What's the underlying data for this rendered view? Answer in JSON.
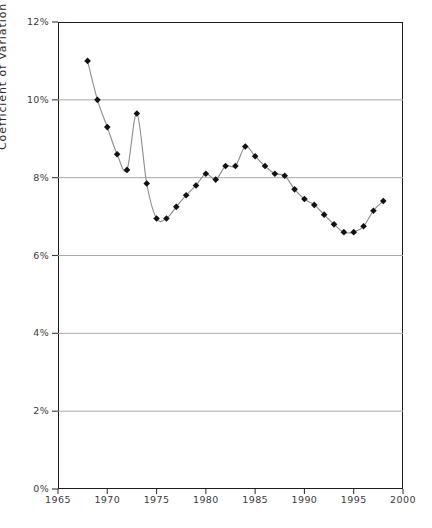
{
  "axes": {
    "y_label": "Coefficient of Variation",
    "y_ticks": [
      "0%",
      "2%",
      "4%",
      "6%",
      "8%",
      "10%",
      "12%"
    ],
    "x_ticks": [
      "1965",
      "1970",
      "1975",
      "1980",
      "1985",
      "1990",
      "1995",
      "2000"
    ]
  },
  "ghost_text": " ",
  "chart_data": {
    "type": "line",
    "title": "",
    "xlabel": "",
    "ylabel": "Coefficient of Variation",
    "xlim": [
      1965,
      2000
    ],
    "ylim": [
      0,
      12
    ],
    "ytick_values": [
      0,
      2,
      4,
      6,
      8,
      10,
      12
    ],
    "ytick_labels": [
      "0%",
      "2%",
      "4%",
      "6%",
      "8%",
      "10%",
      "12%"
    ],
    "xtick_values": [
      1965,
      1970,
      1975,
      1980,
      1985,
      1990,
      1995,
      2000
    ],
    "xtick_labels": [
      "1965",
      "1970",
      "1975",
      "1980",
      "1985",
      "1990",
      "1995",
      "2000"
    ],
    "grid": "horizontal",
    "legend": "none",
    "units": "percent",
    "marker": "diamond",
    "marker_color": "#111111",
    "line_color": "#8d8d8d",
    "x": [
      1968,
      1969,
      1970,
      1971,
      1972,
      1973,
      1974,
      1975,
      1976,
      1977,
      1978,
      1979,
      1980,
      1981,
      1982,
      1983,
      1984,
      1985,
      1986,
      1987,
      1988,
      1989,
      1990,
      1991,
      1992,
      1993,
      1994,
      1995,
      1996,
      1997,
      1998
    ],
    "y": [
      11.0,
      10.0,
      9.3,
      8.6,
      8.2,
      9.65,
      7.85,
      6.95,
      6.95,
      7.25,
      7.55,
      7.8,
      8.1,
      7.95,
      8.3,
      8.3,
      8.8,
      8.55,
      8.3,
      8.1,
      8.05,
      7.7,
      7.45,
      7.3,
      7.05,
      6.8,
      6.6,
      6.6,
      6.75,
      7.15,
      7.4
    ],
    "series": [
      {
        "name": "Coefficient of Variation",
        "values": [
          11.0,
          10.0,
          9.3,
          8.6,
          8.2,
          9.65,
          7.85,
          6.95,
          6.95,
          7.25,
          7.55,
          7.8,
          8.1,
          7.95,
          8.3,
          8.3,
          8.8,
          8.55,
          8.3,
          8.1,
          8.05,
          7.7,
          7.45,
          7.3,
          7.05,
          6.8,
          6.6,
          6.6,
          6.75,
          7.15,
          7.4
        ]
      }
    ]
  }
}
